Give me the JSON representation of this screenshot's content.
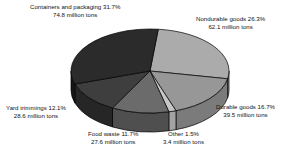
{
  "chart_data": {
    "type": "pie",
    "title": "",
    "subtitle": "",
    "xlabel": "",
    "ylabel": "",
    "grid": false,
    "legend_position": "none",
    "three_d": true,
    "total_label": "236.2 million tons",
    "value_unit": "million tons",
    "categories": [
      "Containers and packaging",
      "Nondurable goods",
      "Durable goods",
      "Other",
      "Food waste",
      "Yard trimmings"
    ],
    "percents": [
      31.7,
      26.3,
      16.7,
      1.5,
      11.7,
      12.1
    ],
    "values": [
      74.8,
      62.1,
      39.5,
      3.4,
      27.6,
      28.6
    ],
    "slices": [
      {
        "name": "Containers and packaging",
        "percent": 31.7,
        "value": 74.8,
        "color": "#2b2b2b",
        "side_color": "#161616",
        "label_line1": "Containers and packaging 31.7%",
        "label_line2": "74.8 million tons"
      },
      {
        "name": "Nondurable goods",
        "percent": 26.3,
        "value": 62.1,
        "color": "#ababab",
        "side_color": "#8d8d8d",
        "label_line1": "Nondurable goods 26.3%",
        "label_line2": "62.1 million tons"
      },
      {
        "name": "Durable goods",
        "percent": 16.7,
        "value": 39.5,
        "color": "#979797",
        "side_color": "#7b7b7b",
        "label_line1": "Durable goods 16.7%",
        "label_line2": "39.5 million tons"
      },
      {
        "name": "Other",
        "percent": 1.5,
        "value": 3.4,
        "color": "#c6c6c6",
        "side_color": "#a3a3a3",
        "label_line1": "Other 1.5%",
        "label_line2": "3.4 million tons"
      },
      {
        "name": "Food waste",
        "percent": 11.7,
        "value": 27.6,
        "color": "#6b6b6b",
        "side_color": "#4f4f4f",
        "label_line1": "Food waste 11.7%",
        "label_line2": "27.6 million tons"
      },
      {
        "name": "Yard trimmings",
        "percent": 12.1,
        "value": 28.6,
        "color": "#3e3e3e",
        "side_color": "#262626",
        "label_line1": "Yard trimmings 12.1%",
        "label_line2": "28.6 million tons"
      }
    ],
    "colors": {
      "background": "#ffffff",
      "text": "#111111",
      "outline": "#000000"
    }
  },
  "labels": {
    "containers": {
      "line1": "Containers and packaging 31.7%",
      "line2": "74.8 million tons"
    },
    "nondurable": {
      "line1": "Nondurable goods 26.3%",
      "line2": "62.1 million tons"
    },
    "durable": {
      "line1": "Durable goods 16.7%",
      "line2": "39.5 million tons"
    },
    "other": {
      "line1": "Other 1.5%",
      "line2": "3.4 million tons"
    },
    "food": {
      "line1": "Food waste 11.7%",
      "line2": "27.6 million tons"
    },
    "yard": {
      "line1": "Yard trimmings 12.1%",
      "line2": "28.6 million tons"
    }
  }
}
